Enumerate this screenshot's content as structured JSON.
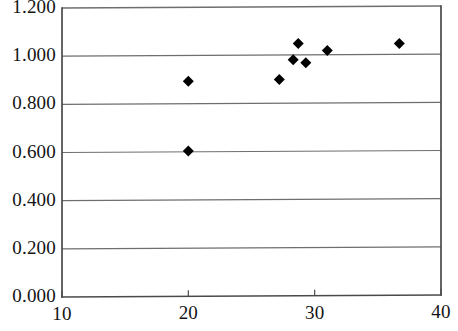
{
  "chart_data": {
    "type": "scatter",
    "title": "",
    "subtitle": "",
    "xlabel": "",
    "ylabel": "",
    "xlim": [
      10,
      40
    ],
    "ylim": [
      0.0,
      1.2
    ],
    "grid": true,
    "grid_axis": "y",
    "legend": false,
    "legend_position": "none",
    "marker": "diamond",
    "marker_color": "#000000",
    "marker_size": 11,
    "x_ticks": [
      10,
      20,
      30,
      40
    ],
    "x_tick_labels": [
      "10",
      "20",
      "30",
      "40"
    ],
    "y_ticks": [
      0.0,
      0.2,
      0.4,
      0.6,
      0.8,
      1.0,
      1.2
    ],
    "y_tick_labels": [
      "0.000",
      "0.200",
      "0.400",
      "0.600",
      "0.800",
      "1.000",
      "1.200"
    ],
    "series": [
      {
        "name": "series-1",
        "color": "#000000",
        "points": [
          {
            "x": 20.0,
            "y": 0.893
          },
          {
            "x": 20.0,
            "y": 0.603
          },
          {
            "x": 27.2,
            "y": 0.898
          },
          {
            "x": 28.3,
            "y": 0.98
          },
          {
            "x": 28.7,
            "y": 1.047
          },
          {
            "x": 29.3,
            "y": 0.967
          },
          {
            "x": 31.0,
            "y": 1.018
          },
          {
            "x": 36.7,
            "y": 1.045
          }
        ]
      }
    ]
  },
  "axes": {
    "left_px": 62,
    "right_px": 441,
    "top_px": 8,
    "bottom_px": 297,
    "axis_color": "#4a4a4a",
    "grid_color": "#6e6e6e",
    "background": "#ffffff"
  }
}
